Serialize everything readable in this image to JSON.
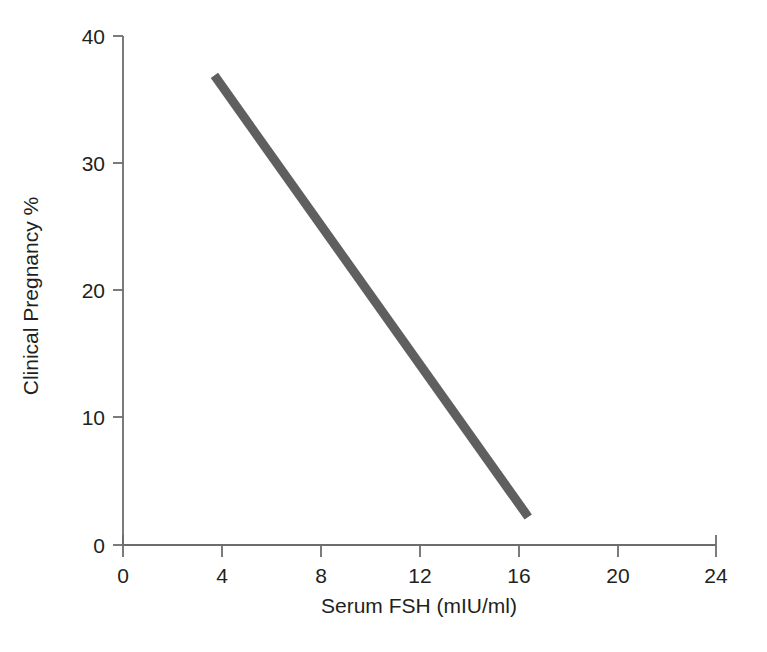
{
  "chart_data": {
    "type": "line",
    "title": "",
    "subtitle": "",
    "xlabel": "Serum FSH (mIU/ml)",
    "ylabel": "Clinical Pregnancy %",
    "xlim": [
      0,
      24
    ],
    "ylim": [
      0,
      40
    ],
    "xticks": [
      0,
      4,
      8,
      12,
      16,
      20,
      24
    ],
    "yticks": [
      0,
      10,
      20,
      30,
      40
    ],
    "xtick_labels": [
      "0",
      "4",
      "8",
      "12",
      "16",
      "20",
      "24"
    ],
    "ytick_labels": [
      "0",
      "10",
      "20",
      "30",
      "40"
    ],
    "grid": false,
    "legend": null,
    "annotations": [],
    "series": [
      {
        "name": "Clinical Pregnancy %",
        "color": "#5f5f5f",
        "line_width_px": 9,
        "x": [
          3.7,
          16.4
        ],
        "values": [
          36.9,
          2.2
        ],
        "points": [
          {
            "x": 3.7,
            "y": 36.9
          },
          {
            "x": 16.4,
            "y": 2.2
          }
        ]
      }
    ]
  },
  "figure": {
    "background_color": "#ffffff",
    "axis_color": "#6d6d6d",
    "text_color": "#231f20",
    "line_color": "#5f5f5f"
  }
}
